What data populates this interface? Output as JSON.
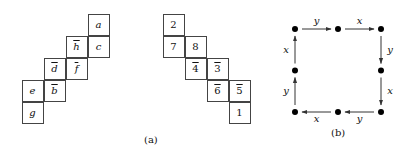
{
  "panel_a": {
    "caption": "(a)",
    "left_grid": [
      {
        "label": "a",
        "bar": false,
        "col": 3,
        "row": 0
      },
      {
        "label": "h",
        "bar": true,
        "col": 2,
        "row": 1
      },
      {
        "label": "c",
        "bar": false,
        "col": 3,
        "row": 1
      },
      {
        "label": "d",
        "bar": true,
        "col": 1,
        "row": 2
      },
      {
        "label": "f",
        "bar": true,
        "col": 2,
        "row": 2
      },
      {
        "label": "e",
        "bar": false,
        "col": 0,
        "row": 3
      },
      {
        "label": "b",
        "bar": true,
        "col": 1,
        "row": 3
      },
      {
        "label": "g",
        "bar": false,
        "col": 0,
        "row": 4
      }
    ],
    "right_grid": [
      {
        "label": "2",
        "bar": false,
        "col": 0,
        "row": 0
      },
      {
        "label": "7",
        "bar": false,
        "col": 0,
        "row": 1
      },
      {
        "label": "8",
        "bar": false,
        "col": 1,
        "row": 1
      },
      {
        "label": "4",
        "bar": true,
        "col": 1,
        "row": 2
      },
      {
        "label": "3",
        "bar": true,
        "col": 2,
        "row": 2
      },
      {
        "label": "6",
        "bar": true,
        "col": 2,
        "row": 3
      },
      {
        "label": "5",
        "bar": true,
        "col": 3,
        "row": 3
      },
      {
        "label": "1",
        "bar": false,
        "col": 3,
        "row": 4
      }
    ]
  },
  "panel_b": {
    "caption": "(b)",
    "nodes": [
      {
        "id": "tl",
        "gx": 0,
        "gy": 0
      },
      {
        "id": "tm",
        "gx": 1,
        "gy": 0
      },
      {
        "id": "tr",
        "gx": 2,
        "gy": 0
      },
      {
        "id": "mr",
        "gx": 2,
        "gy": 1
      },
      {
        "id": "br",
        "gx": 2,
        "gy": 2
      },
      {
        "id": "bm",
        "gx": 1,
        "gy": 2
      },
      {
        "id": "bl",
        "gx": 0,
        "gy": 2
      },
      {
        "id": "ml",
        "gx": 0,
        "gy": 1
      }
    ],
    "edges": [
      {
        "from": "tl",
        "to": "tm",
        "label": "y"
      },
      {
        "from": "tm",
        "to": "tr",
        "label": "x"
      },
      {
        "from": "tr",
        "to": "mr",
        "label": "y"
      },
      {
        "from": "mr",
        "to": "br",
        "label": "x"
      },
      {
        "from": "br",
        "to": "bm",
        "label": "y"
      },
      {
        "from": "bm",
        "to": "bl",
        "label": "x"
      },
      {
        "from": "bl",
        "to": "ml",
        "label": "y"
      },
      {
        "from": "ml",
        "to": "tl",
        "label": "x"
      }
    ]
  }
}
